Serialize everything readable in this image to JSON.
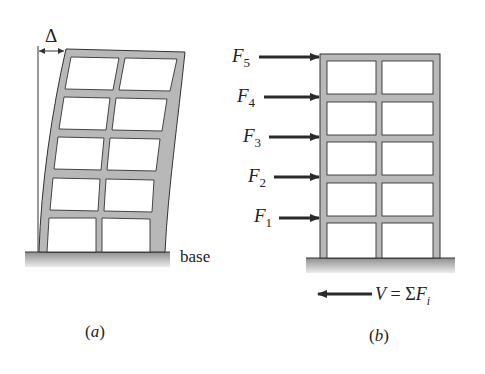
{
  "figure": {
    "panel_a": {
      "caption": "(a)",
      "delta_label": "Δ",
      "base_label": "base",
      "stories": 5,
      "bays": 2
    },
    "panel_b": {
      "caption": "(b)",
      "stories": 5,
      "bays": 2,
      "forces": [
        {
          "name": "F",
          "sub": "5"
        },
        {
          "name": "F",
          "sub": "4"
        },
        {
          "name": "F",
          "sub": "3"
        },
        {
          "name": "F",
          "sub": "2"
        },
        {
          "name": "F",
          "sub": "1"
        }
      ],
      "base_shear": {
        "lhs": "V",
        "eq": " = ",
        "sum": "Σ",
        "F": "F",
        "sub": "i"
      }
    },
    "colors": {
      "frame_fill": "#b8b8b8",
      "frame_stroke": "#333333",
      "ground_top": "#9a9a9a",
      "ground_bottom": "#e6e6e6",
      "arrow": "#2a2a2a"
    }
  }
}
